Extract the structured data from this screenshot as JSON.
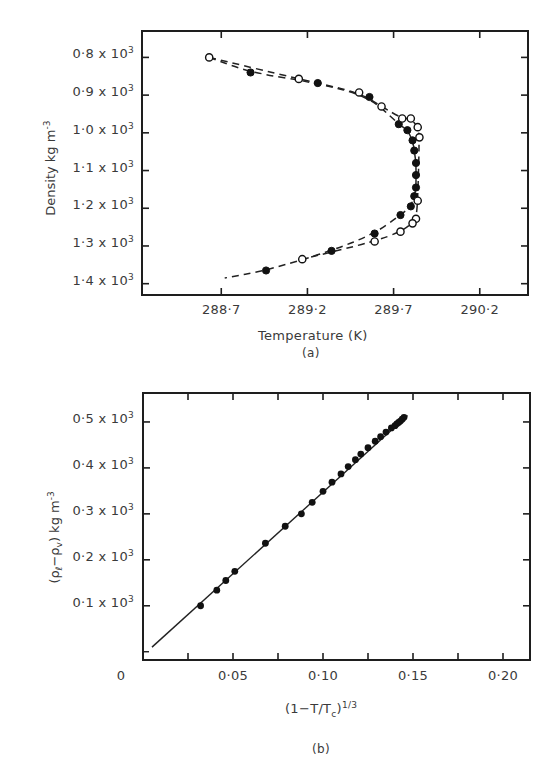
{
  "figure": {
    "panel_a_caption": "(a)",
    "panel_b_caption": "(b)"
  },
  "chart_data": [
    {
      "type": "scatter",
      "title": "",
      "caption": "(a)",
      "xlabel": "Temperature (K)",
      "ylabel": "Density kg m",
      "ylabel_exponent": "-3",
      "xlim": [
        288.24,
        290.48
      ],
      "ylim": [
        1.43,
        0.73
      ],
      "y_inverted": true,
      "x_ticks": [
        "288·7",
        "289·2",
        "289·7",
        "290·2"
      ],
      "x_tick_values": [
        288.7,
        289.2,
        289.7,
        290.2
      ],
      "y_ticks": [
        "0·8 x 10",
        "0·9 x 10",
        "1·0 x 10",
        "1·1 x 10",
        "1·2 x 10",
        "1·3 x 10",
        "1·4 x 10"
      ],
      "y_tick_exponent": "3",
      "y_tick_values": [
        0.8,
        0.9,
        1.0,
        1.1,
        1.2,
        1.3,
        1.4
      ],
      "y_unit_scale": 1000,
      "grid": false,
      "legend": null,
      "series": [
        {
          "name": "open circles",
          "marker": "open-circle",
          "line": "dashed",
          "x": [
            288.63,
            289.15,
            289.5,
            289.63,
            289.75,
            289.8,
            289.84,
            289.85,
            289.84,
            289.83,
            289.81,
            289.74,
            289.59,
            289.17
          ],
          "y": [
            0.8,
            0.857,
            0.893,
            0.93,
            0.962,
            0.962,
            0.985,
            1.012,
            1.18,
            1.228,
            1.24,
            1.262,
            1.288,
            1.335
          ]
        },
        {
          "name": "filled circles",
          "marker": "filled-circle",
          "line": "dashed",
          "x": [
            288.87,
            289.26,
            289.56,
            289.73,
            289.78,
            289.81,
            289.82,
            289.83,
            289.83,
            289.83,
            289.82,
            289.8,
            289.74,
            289.59,
            289.34,
            288.96
          ],
          "y": [
            0.84,
            0.868,
            0.905,
            0.977,
            0.993,
            1.02,
            1.047,
            1.08,
            1.112,
            1.145,
            1.168,
            1.195,
            1.218,
            1.267,
            1.313,
            1.365
          ]
        }
      ],
      "dashed_curves": {
        "upper_open_start": [
          288.63,
          0.8
        ],
        "lower_open_end": [
          289.17,
          1.335
        ],
        "lower_curve_end": [
          288.72,
          1.385
        ]
      }
    },
    {
      "type": "scatter",
      "title": "",
      "caption": "(b)",
      "xlabel": "(1−T/T",
      "xlabel_sub": "c",
      "xlabel_tail": ")",
      "xlabel_sup": "1/3",
      "ylabel": "(ρ",
      "ylabel_sub1": "ℓ",
      "ylabel_mid": "−ρ",
      "ylabel_sub2": "v",
      "ylabel_tail": ") kg m",
      "ylabel_exponent": "-3",
      "xlim": [
        0,
        0.215
      ],
      "ylim": [
        -0.018,
        0.563
      ],
      "x_ticks": [
        "0",
        "0·05",
        "0·10",
        "0·15",
        "0·20"
      ],
      "x_tick_values": [
        0,
        0.05,
        0.1,
        0.15,
        0.2
      ],
      "y_ticks": [
        "0·1 x 10",
        "0·2 x 10",
        "0·3 x 10",
        "0·4 x 10",
        "0·5 x 10"
      ],
      "y_tick_exponent": "3",
      "y_tick_values": [
        0.1,
        0.2,
        0.3,
        0.4,
        0.5
      ],
      "y_unit_scale": 1000,
      "grid": false,
      "legend": null,
      "fit_line": {
        "x": [
          0.005,
          0.147
        ],
        "y": [
          0.01,
          0.514
        ]
      },
      "series": [
        {
          "name": "measured",
          "marker": "filled-circle",
          "x": [
            0.032,
            0.041,
            0.046,
            0.051,
            0.068,
            0.079,
            0.088,
            0.094,
            0.1,
            0.105,
            0.11,
            0.114,
            0.118,
            0.121,
            0.125,
            0.129,
            0.132,
            0.135,
            0.138,
            0.14,
            0.141,
            0.142,
            0.143,
            0.144,
            0.145
          ],
          "y": [
            0.1,
            0.134,
            0.155,
            0.175,
            0.236,
            0.273,
            0.3,
            0.325,
            0.349,
            0.369,
            0.387,
            0.403,
            0.418,
            0.43,
            0.444,
            0.458,
            0.468,
            0.478,
            0.487,
            0.492,
            0.496,
            0.499,
            0.502,
            0.506,
            0.51
          ]
        }
      ]
    }
  ]
}
